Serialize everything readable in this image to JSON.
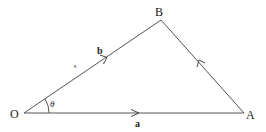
{
  "diagram": {
    "points": {
      "O": {
        "label": "O",
        "x": 24,
        "y": 113
      },
      "A": {
        "label": "A",
        "x": 244,
        "y": 113
      },
      "B": {
        "label": "B",
        "x": 161,
        "y": 20
      }
    },
    "vectors": {
      "a": {
        "label": "a",
        "from": "O",
        "to": "A"
      },
      "b": {
        "label": "b",
        "from": "O",
        "to": "B"
      },
      "AB": {
        "from": "A",
        "to": "B"
      }
    },
    "angle": {
      "label": "θ",
      "at": "O"
    },
    "mark": {
      "label": "s"
    },
    "colors": {
      "line": "#555555",
      "text": "#222222"
    }
  }
}
